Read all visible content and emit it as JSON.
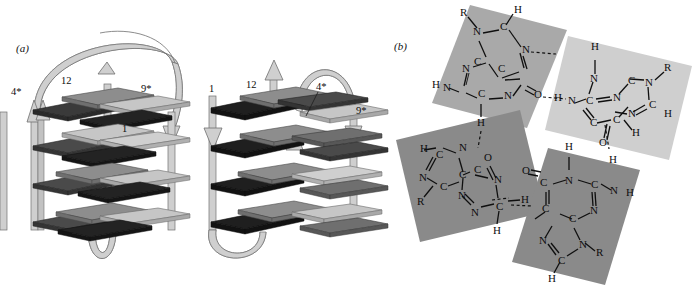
{
  "figure": {
    "panels": [
      {
        "id": "a",
        "label": "(a)",
        "description": "Two schematic G-quadruplex folding topologies drawn as four stacked G-tetrad layers of ribbon-like plates connected by loop strands with directional arrows.",
        "structures": [
          {
            "name": "left-topology",
            "layers": 4,
            "plates_per_layer": 4,
            "loops": [
              "top-arch",
              "bottom-loop",
              "central-descending",
              "left-ascending"
            ],
            "labels": [
              {
                "text": "4*",
                "x": 11,
                "y": 91
              },
              {
                "text": "12",
                "x": 61,
                "y": 80
              },
              {
                "text": "9*",
                "x": 141,
                "y": 88
              },
              {
                "text": "1",
                "x": 122,
                "y": 128
              }
            ]
          },
          {
            "name": "right-topology",
            "layers": 4,
            "plates_per_layer": 4,
            "loops": [
              "top-arch",
              "bottom-loop",
              "left-descending",
              "central-ascending"
            ],
            "labels": [
              {
                "text": "1",
                "x": 212,
                "y": 88
              },
              {
                "text": "12",
                "x": 248,
                "y": 84
              },
              {
                "text": "4*",
                "x": 318,
                "y": 86
              },
              {
                "text": "9*",
                "x": 357,
                "y": 110
              }
            ]
          }
        ]
      },
      {
        "id": "b",
        "label": "(b)",
        "description": "Guanine tetrad (G-quartet): four guanine bases arranged with four-fold rotational symmetry, joined by cyclic Hoogsteen hydrogen bonds (dashed lines).",
        "bases": [
          {
            "position": "top-left",
            "shade": "#a9a9a9",
            "atoms": [
              "R",
              "N",
              "C",
              "H",
              "N",
              "C",
              "C",
              "N",
              "C",
              "N",
              "H",
              "C",
              "O",
              "H"
            ]
          },
          {
            "position": "top-right",
            "shade": "#cfcfcf",
            "atoms": [
              "H",
              "N",
              "C",
              "N",
              "C",
              "N",
              "R",
              "C",
              "C",
              "N",
              "C",
              "H",
              "O",
              "H"
            ]
          },
          {
            "position": "bottom-left",
            "shade": "#8a8a8a",
            "atoms": [
              "H",
              "C",
              "N",
              "N",
              "C",
              "R",
              "C",
              "C",
              "O",
              "N",
              "H",
              "C",
              "N",
              "H"
            ]
          },
          {
            "position": "bottom-right",
            "shade": "#8a8a8a",
            "atoms": [
              "O",
              "C",
              "N",
              "H",
              "C",
              "N",
              "H",
              "C",
              "C",
              "N",
              "N",
              "C",
              "H",
              "R"
            ]
          }
        ],
        "hydrogen_bond_style": "dashed",
        "atom_labels": [
          "N",
          "C",
          "O",
          "H",
          "R"
        ]
      }
    ],
    "colors": {
      "background": "#ffffff",
      "ink": "#111111",
      "plate_dark": "#2e2e2e",
      "plate_mid_dark": "#5a5a5a",
      "plate_mid": "#8d8d8d",
      "plate_light": "#c6c6c6",
      "ribbon": "#c9c9c9",
      "ribbon_edge": "#6f6f6f",
      "quad_dark": "#8a8a8a",
      "quad_mid": "#a9a9a9",
      "quad_light": "#cfcfcf"
    }
  }
}
